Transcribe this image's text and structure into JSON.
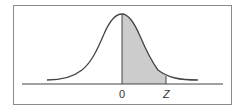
{
  "diagram": {
    "type": "normal-distribution-curve",
    "shaded_region": {
      "from": "0",
      "to": "Z"
    },
    "axis_labels": {
      "zero": "0",
      "z": "Z"
    },
    "colors": {
      "curve": "#444444",
      "shade": "#cccccc",
      "axis": "#444444",
      "border": "#8a8a8a"
    }
  }
}
